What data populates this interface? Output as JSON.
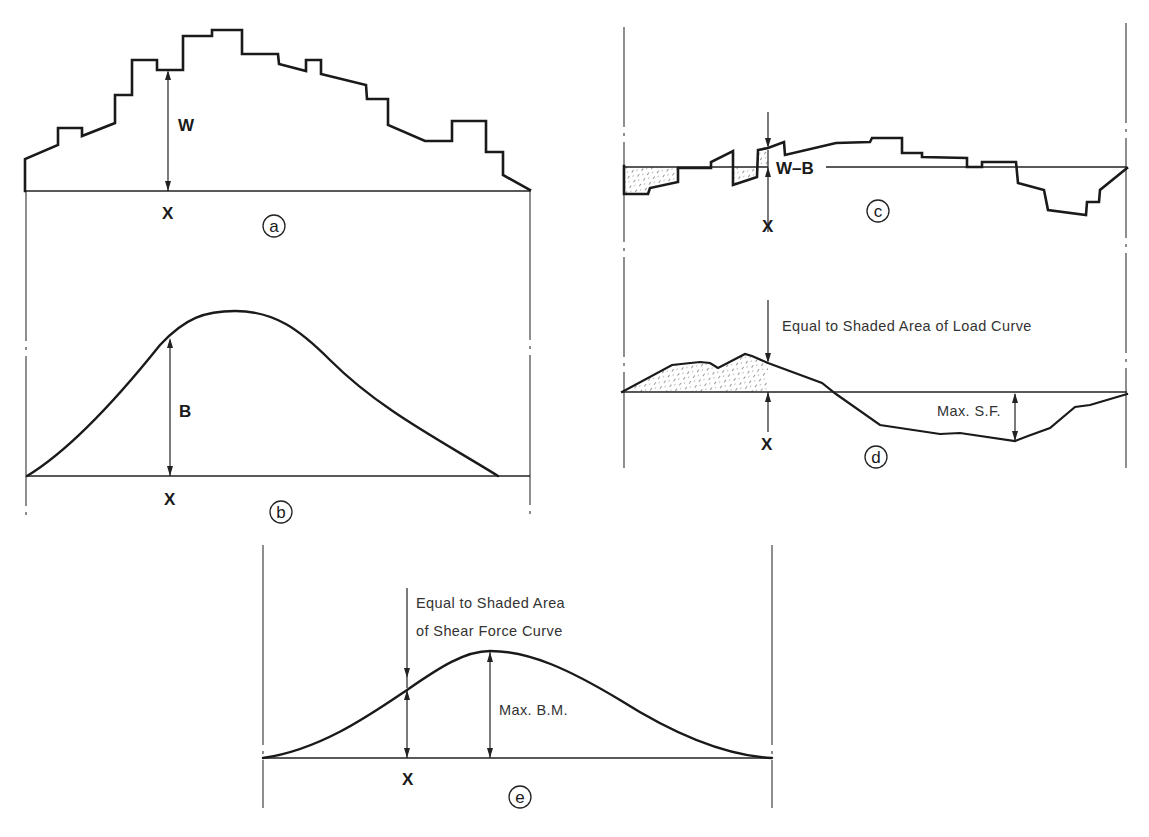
{
  "figure": {
    "panels": [
      {
        "id": "a",
        "caption_letter": "a",
        "quantity_label": "W",
        "station_label": "X",
        "description": "Weight curve",
        "kind": "step"
      },
      {
        "id": "b",
        "caption_letter": "b",
        "quantity_label": "B",
        "station_label": "X",
        "description": "Buoyancy curve",
        "kind": "smooth"
      },
      {
        "id": "c",
        "caption_letter": "c",
        "quantity_label": "W–B",
        "station_label": "X",
        "description": "Load curve",
        "kind": "step"
      },
      {
        "id": "d",
        "caption_letter": "d",
        "quantity_label": "Max. S.F.",
        "station_label": "X",
        "note": "Equal to Shaded Area of Load Curve",
        "description": "Shear force curve",
        "kind": "polyline"
      },
      {
        "id": "e",
        "caption_letter": "e",
        "quantity_label": "Max. B.M.",
        "station_label": "X",
        "note_line1": "Equal to Shaded Area",
        "note_line2": "of Shear Force Curve",
        "description": "Bending moment curve",
        "kind": "smooth"
      }
    ]
  },
  "chart_data": [
    {
      "type": "line",
      "panel": "a",
      "title": "Weight curve",
      "ylabel": "W",
      "xlabel": "X",
      "baseline_y": 191,
      "x_range": [
        25,
        530
      ],
      "points": [
        [
          25,
          191
        ],
        [
          25,
          159
        ],
        [
          58,
          145
        ],
        [
          58,
          128
        ],
        [
          82,
          128
        ],
        [
          82,
          136
        ],
        [
          115,
          123
        ],
        [
          115,
          95
        ],
        [
          132,
          95
        ],
        [
          132,
          60
        ],
        [
          157,
          60
        ],
        [
          157,
          70
        ],
        [
          183,
          70
        ],
        [
          183,
          36
        ],
        [
          212,
          36
        ],
        [
          212,
          30
        ],
        [
          242,
          30
        ],
        [
          242,
          54
        ],
        [
          278,
          54
        ],
        [
          279,
          64
        ],
        [
          306,
          71
        ],
        [
          306,
          60
        ],
        [
          321,
          60
        ],
        [
          321,
          74
        ],
        [
          366,
          85
        ],
        [
          367,
          99
        ],
        [
          388,
          99
        ],
        [
          388,
          125
        ],
        [
          425,
          141
        ],
        [
          452,
          141
        ],
        [
          452,
          121
        ],
        [
          486,
          121
        ],
        [
          486,
          152
        ],
        [
          503,
          152
        ],
        [
          503,
          175
        ],
        [
          530,
          190
        ]
      ],
      "station": {
        "x": 168,
        "top": 70,
        "bottom": 191
      }
    },
    {
      "type": "line",
      "panel": "b",
      "title": "Buoyancy curve",
      "ylabel": "B",
      "xlabel": "X",
      "baseline_y": 476,
      "x_range": [
        27,
        498
      ],
      "peak": [
        235,
        311
      ],
      "path": "M27,476 C70,450 120,395 160,345 C185,318 205,311 235,311 C275,311 300,330 330,360 C380,410 440,440 498,476",
      "station": {
        "x": 170,
        "top": 338,
        "bottom": 476
      }
    },
    {
      "type": "line",
      "panel": "c",
      "title": "Load curve",
      "ylabel": "W–B",
      "xlabel": "X",
      "baseline_y": 167,
      "x_range": [
        624,
        1127
      ],
      "points": [
        [
          624,
          166
        ],
        [
          624,
          194
        ],
        [
          648,
          194
        ],
        [
          650,
          188
        ],
        [
          678,
          182
        ],
        [
          678,
          168
        ],
        [
          711,
          168
        ],
        [
          711,
          162
        ],
        [
          733,
          151
        ],
        [
          733,
          185
        ],
        [
          757,
          177
        ],
        [
          758,
          150
        ],
        [
          768,
          148
        ],
        [
          784,
          142
        ],
        [
          785,
          155
        ],
        [
          836,
          143
        ],
        [
          870,
          142
        ],
        [
          872,
          138
        ],
        [
          902,
          138
        ],
        [
          902,
          153
        ],
        [
          922,
          153
        ],
        [
          922,
          157
        ],
        [
          967,
          158
        ],
        [
          967,
          167
        ],
        [
          982,
          167
        ],
        [
          982,
          162
        ],
        [
          1016,
          162
        ],
        [
          1018,
          183
        ],
        [
          1044,
          190
        ],
        [
          1048,
          210
        ],
        [
          1086,
          215
        ],
        [
          1087,
          202
        ],
        [
          1099,
          202
        ],
        [
          1100,
          190
        ],
        [
          1127,
          168
        ]
      ],
      "shaded_regions": [
        [
          [
            624,
            167
          ],
          [
            624,
            194
          ],
          [
            648,
            194
          ],
          [
            650,
            188
          ],
          [
            678,
            182
          ],
          [
            678,
            168
          ],
          [
            711,
            168
          ],
          [
            711,
            167
          ]
        ],
        [
          [
            733,
            167
          ],
          [
            733,
            185
          ],
          [
            757,
            177
          ],
          [
            758,
            167
          ]
        ],
        [
          [
            758,
            167
          ],
          [
            758,
            150
          ],
          [
            768,
            148
          ],
          [
            768,
            167
          ]
        ]
      ],
      "station": {
        "x": 768,
        "top": 112,
        "bottom": 230
      }
    },
    {
      "type": "line",
      "panel": "d",
      "title": "Shear force curve",
      "ylabel": "Max. S.F.",
      "xlabel": "X",
      "baseline_y": 392,
      "x_range": [
        622,
        1127
      ],
      "points": [
        [
          622,
          392
        ],
        [
          672,
          365
        ],
        [
          700,
          362
        ],
        [
          710,
          363
        ],
        [
          718,
          368
        ],
        [
          745,
          354
        ],
        [
          752,
          356
        ],
        [
          768,
          363
        ],
        [
          822,
          383
        ],
        [
          836,
          394
        ],
        [
          880,
          425
        ],
        [
          940,
          434
        ],
        [
          960,
          433
        ],
        [
          1015,
          441
        ],
        [
          1028,
          436
        ],
        [
          1050,
          428
        ],
        [
          1075,
          407
        ],
        [
          1090,
          405
        ],
        [
          1127,
          394
        ]
      ],
      "shaded_region": [
        [
          622,
          392
        ],
        [
          672,
          365
        ],
        [
          700,
          362
        ],
        [
          710,
          363
        ],
        [
          718,
          368
        ],
        [
          745,
          354
        ],
        [
          752,
          356
        ],
        [
          768,
          363
        ],
        [
          768,
          392
        ]
      ],
      "max_sf_x": 1015,
      "station": {
        "x": 768,
        "top": 300,
        "bottom": 392
      }
    },
    {
      "type": "line",
      "panel": "e",
      "title": "Bending moment curve",
      "ylabel": "Max. B.M.",
      "xlabel": "X",
      "baseline_y": 758,
      "x_range": [
        263,
        772
      ],
      "peak": [
        490,
        651
      ],
      "path": "M263,758 C320,750 370,715 407,690 C440,667 465,651 490,651 C530,651 570,670 620,700 C680,738 730,756 772,758",
      "station": {
        "x": 407,
        "top": 588,
        "curve_y": 690,
        "bottom": 758
      },
      "max_bm_x": 490
    }
  ]
}
